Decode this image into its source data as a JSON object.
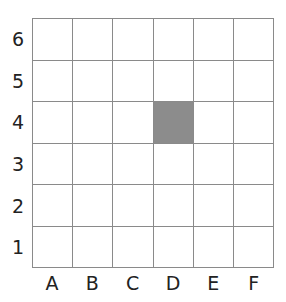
{
  "grid": {
    "rows": [
      "6",
      "5",
      "4",
      "3",
      "2",
      "1"
    ],
    "columns": [
      "A",
      "B",
      "C",
      "D",
      "E",
      "F"
    ],
    "shaded_cells": [
      {
        "column": "D",
        "row": "4",
        "color": "#8c8c8c"
      }
    ],
    "line_color": "#8a8a8a"
  }
}
